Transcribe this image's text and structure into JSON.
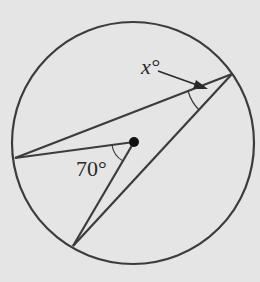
{
  "diagram": {
    "labels": {
      "inscribed_angle": "x°",
      "central_angle": "70°"
    },
    "colors": {
      "background": "#e5e5e5",
      "stroke": "#3c3c3c",
      "text": "#2a2a2a"
    },
    "circle": {
      "cx": 133,
      "cy": 143,
      "r": 121
    },
    "points": {
      "center": [
        134,
        142
      ],
      "left": [
        15,
        158
      ],
      "bottom": [
        73,
        246
      ],
      "right": [
        232,
        74
      ]
    }
  }
}
